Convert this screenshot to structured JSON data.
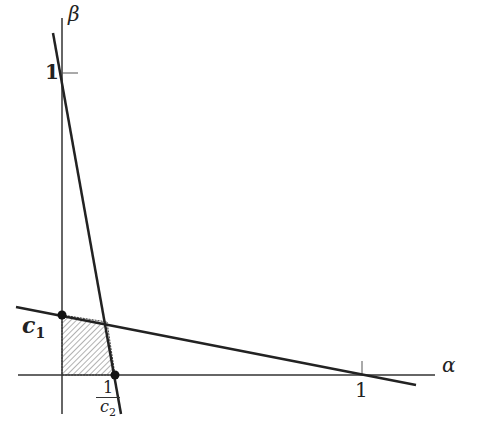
{
  "axes": {
    "x_label": "α",
    "y_label": "β"
  },
  "ticks": {
    "x_one": "1",
    "y_one": "1"
  },
  "points": {
    "c1_label": "c",
    "c1_sub": "1",
    "c2_num": "1",
    "c2_den": "c",
    "c2_sub": "2"
  },
  "colors": {
    "ink": "#222222",
    "hatch": "#555555"
  }
}
